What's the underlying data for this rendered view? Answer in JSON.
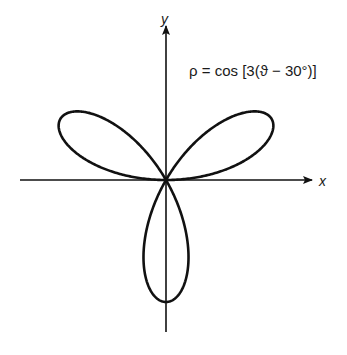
{
  "figure": {
    "equation": "ρ = cos [3(ϑ − 30°)]",
    "x_axis_label": "x",
    "y_axis_label": "y",
    "curve": {
      "type": "rose",
      "function": "rho = cos(3*(theta - 30deg))",
      "petals": 3,
      "petal_directions_deg": [
        30,
        150,
        270
      ],
      "amplitude": 1
    },
    "colors": {
      "background": "#ffffff",
      "ink": "#111111"
    }
  }
}
